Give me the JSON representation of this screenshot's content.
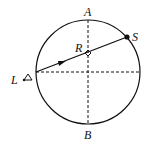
{
  "diagram": {
    "labels": {
      "top": "A",
      "bottom": "B",
      "left": "L",
      "right_point": "S",
      "center_point": "R"
    },
    "stroke_color": "#111111",
    "background": "#ffffff"
  }
}
